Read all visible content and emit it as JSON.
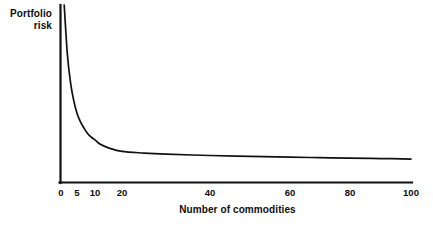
{
  "figure": {
    "background_color": "#ffffff",
    "ink_color": "#111111"
  },
  "axes": {
    "y_axis_title_line1": "Portfolio",
    "y_axis_title_line2": "risk",
    "x_axis_title": "Number of commodities",
    "x_tick_labels": [
      "0",
      "5",
      "10",
      "20",
      "40",
      "60",
      "80",
      "100"
    ],
    "x_tick_pixel_positions": [
      61,
      77,
      95,
      122,
      210,
      290,
      350,
      411
    ],
    "y_tick_labels": []
  },
  "chart_data": {
    "type": "line",
    "title": "",
    "subtitle": "",
    "xlabel": "Number of commodities",
    "ylabel": "Portfolio risk",
    "xlim": [
      0,
      100
    ],
    "ylim": [
      0,
      100
    ],
    "grid": false,
    "legend": null,
    "axis_scale_note": "x-axis spacing is compressed at low values (quasi-logarithmic): 0,5,10,20 are close together while 40,60,80,100 are evenly spread",
    "series": [
      {
        "name": "Portfolio risk",
        "x": [
          1,
          2,
          3,
          4,
          5,
          6,
          7,
          8,
          9,
          10,
          12,
          15,
          20,
          25,
          30,
          40,
          50,
          60,
          70,
          80,
          90,
          100
        ],
        "y": [
          100,
          72,
          56,
          46,
          39,
          34,
          30.5,
          27.5,
          25.5,
          24,
          21.5,
          19.5,
          17.5,
          16.6,
          16.0,
          15.2,
          14.7,
          14.3,
          14.0,
          13.7,
          13.5,
          13.2
        ],
        "description": "Hyperbolic decline of portfolio risk toward an asymptote as the number of commodities held increases (diversification effect)"
      }
    ],
    "annotations": []
  }
}
